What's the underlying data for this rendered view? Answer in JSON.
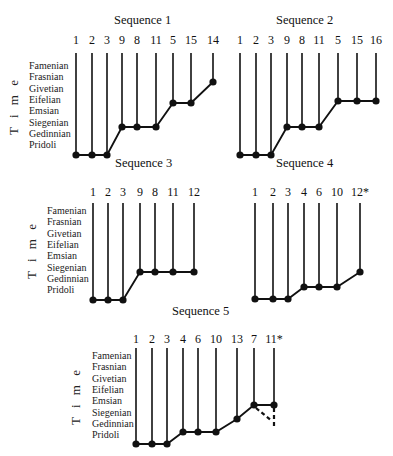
{
  "figure": {
    "time_axis_label": "T i m e",
    "stages": [
      "Famenian",
      "Frasnian",
      "Givetian",
      "Eifelian",
      "Emsian",
      "Siegenian",
      "Gedinnian",
      "Pridoli"
    ]
  },
  "panels": [
    {
      "title": "Sequence 1",
      "title_pos": [
        114,
        24
      ],
      "show_stages": true,
      "stage_x": 29,
      "stage_y0": 69,
      "stage_dy": 11.3,
      "time_pos": [
        18,
        106
      ],
      "label_y": 44,
      "stem_top": 53,
      "taxa": [
        {
          "label": "1",
          "x": 76,
          "y": 155
        },
        {
          "label": "2",
          "x": 92,
          "y": 155
        },
        {
          "label": "3",
          "x": 107,
          "y": 155
        },
        {
          "label": "9",
          "x": 122,
          "y": 127
        },
        {
          "label": "8",
          "x": 137,
          "y": 127
        },
        {
          "label": "11",
          "x": 156,
          "y": 127
        },
        {
          "label": "5",
          "x": 173,
          "y": 103
        },
        {
          "label": "15",
          "x": 191,
          "y": 103
        },
        {
          "label": "14",
          "x": 213,
          "y": 82
        }
      ]
    },
    {
      "title": "Sequence 2",
      "title_pos": [
        276,
        24
      ],
      "show_stages": false,
      "label_y": 44,
      "stem_top": 53,
      "taxa": [
        {
          "label": "1",
          "x": 240,
          "y": 155
        },
        {
          "label": "2",
          "x": 256,
          "y": 155
        },
        {
          "label": "3",
          "x": 271,
          "y": 155
        },
        {
          "label": "9",
          "x": 287,
          "y": 127
        },
        {
          "label": "8",
          "x": 302,
          "y": 127
        },
        {
          "label": "11",
          "x": 319,
          "y": 127
        },
        {
          "label": "5",
          "x": 338,
          "y": 101
        },
        {
          "label": "15",
          "x": 357,
          "y": 101
        },
        {
          "label": "16",
          "x": 376,
          "y": 101
        }
      ]
    },
    {
      "title": "Sequence 3",
      "title_pos": [
        115,
        167
      ],
      "show_stages": true,
      "stage_x": 47,
      "stage_y0": 214,
      "stage_dy": 11.3,
      "time_pos": [
        36,
        250
      ],
      "label_y": 196,
      "stem_top": 203,
      "taxa": [
        {
          "label": "1",
          "x": 93,
          "y": 300
        },
        {
          "label": "2",
          "x": 108,
          "y": 300
        },
        {
          "label": "3",
          "x": 123,
          "y": 300
        },
        {
          "label": "9",
          "x": 140,
          "y": 272
        },
        {
          "label": "8",
          "x": 155,
          "y": 272
        },
        {
          "label": "11",
          "x": 173,
          "y": 272
        },
        {
          "label": "12",
          "x": 194,
          "y": 272
        }
      ]
    },
    {
      "title": "Sequence 4",
      "title_pos": [
        276,
        167
      ],
      "show_stages": false,
      "label_y": 196,
      "stem_top": 203,
      "taxa": [
        {
          "label": "1",
          "x": 255,
          "y": 299
        },
        {
          "label": "2",
          "x": 273,
          "y": 299
        },
        {
          "label": "3",
          "x": 288,
          "y": 299
        },
        {
          "label": "4",
          "x": 304,
          "y": 287
        },
        {
          "label": "6",
          "x": 319,
          "y": 287
        },
        {
          "label": "10",
          "x": 337,
          "y": 287
        },
        {
          "label": "12*",
          "x": 360,
          "y": 272
        }
      ]
    },
    {
      "title": "Sequence 5",
      "title_pos": [
        172,
        315
      ],
      "show_stages": true,
      "stage_x": 92,
      "stage_y0": 359,
      "stage_dy": 11.3,
      "time_pos": [
        80,
        396
      ],
      "label_y": 343,
      "stem_top": 348,
      "taxa": [
        {
          "label": "1",
          "x": 136,
          "y": 444
        },
        {
          "label": "2",
          "x": 152,
          "y": 444
        },
        {
          "label": "3",
          "x": 167,
          "y": 444
        },
        {
          "label": "4",
          "x": 183,
          "y": 432
        },
        {
          "label": "6",
          "x": 198,
          "y": 432
        },
        {
          "label": "10",
          "x": 216,
          "y": 432
        },
        {
          "label": "13",
          "x": 237,
          "y": 419
        },
        {
          "label": "7",
          "x": 254,
          "y": 405
        },
        {
          "label": "11*",
          "x": 274,
          "y": 405
        }
      ],
      "dashed": [
        {
          "from": [
            256,
            408
          ],
          "to": [
            272,
            421
          ]
        },
        {
          "from": [
            274,
            408
          ],
          "to": [
            274,
            426
          ]
        }
      ]
    }
  ]
}
